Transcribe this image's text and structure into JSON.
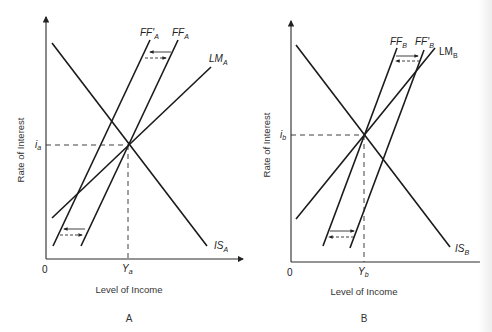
{
  "panels": [
    {
      "id": "A",
      "panel_label": "A",
      "x_axis_label": "Level of Income",
      "y_axis_label": "Rate of Interest",
      "origin_label": "0",
      "equilibrium": {
        "y_label": "Y",
        "y_sub": "a",
        "i_label": "i",
        "i_sub": "a"
      },
      "curves": [
        {
          "name": "IS",
          "sub": "A",
          "type": "downward"
        },
        {
          "name": "LM",
          "sub": "A",
          "type": "upward"
        },
        {
          "name": "FF",
          "sub": "A",
          "type": "steep upward"
        },
        {
          "name": "FF'",
          "sub": "A",
          "type": "steep upward (shifted left)"
        }
      ],
      "shift": "FF_A shifts left to FF'_A"
    },
    {
      "id": "B",
      "panel_label": "B",
      "x_axis_label": "Level of Income",
      "y_axis_label": "Rate of Interest",
      "origin_label": "0",
      "equilibrium": {
        "y_label": "Y",
        "y_sub": "b",
        "i_label": "i",
        "i_sub": "b"
      },
      "curves": [
        {
          "name": "IS",
          "sub": "B",
          "type": "downward"
        },
        {
          "name": "LM",
          "sub": "B",
          "type": "upward"
        },
        {
          "name": "FF",
          "sub": "B",
          "type": "steep upward"
        },
        {
          "name": "FF'",
          "sub": "B",
          "type": "steep upward (shifted right)"
        }
      ],
      "shift": "FF_B shifts right to FF'_B"
    }
  ],
  "labels": {
    "ffa_prime": "FF'",
    "ffa": "FF",
    "lma": "LM",
    "isa": "IS",
    "sub_a": "A",
    "ffb": "FF",
    "ffb_prime": "FF'",
    "lmb": "LM",
    "isb": "IS",
    "sub_b": "B",
    "ya": "Y",
    "ya_sub": "a",
    "ia": "i",
    "ia_sub": "a",
    "yb": "Y",
    "yb_sub": "b",
    "ib": "i",
    "ib_sub": "b",
    "zero": "0",
    "x_axis": "Level of Income",
    "y_axis": "Rate of Interest",
    "panel_a": "A",
    "panel_b": "B"
  }
}
